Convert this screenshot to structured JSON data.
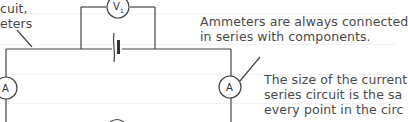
{
  "annotations": {
    "left_line1": "cuit,",
    "left_line2": "eters",
    "right_top_line1": "Ammeters are always connected",
    "right_top_line2": "in series with components.",
    "right_bottom_line1": "The size of the current",
    "right_bottom_line2": "series circuit is the sa",
    "right_bottom_line3": "every point in the circ"
  },
  "components": {
    "voltmeter_label": "V",
    "voltmeter_subscript": "1",
    "ammeter_left_label": "A",
    "ammeter_right_label": "A"
  },
  "colors": {
    "wire": "#444444",
    "text": "#4a4a4a",
    "background": "#ffffff"
  }
}
